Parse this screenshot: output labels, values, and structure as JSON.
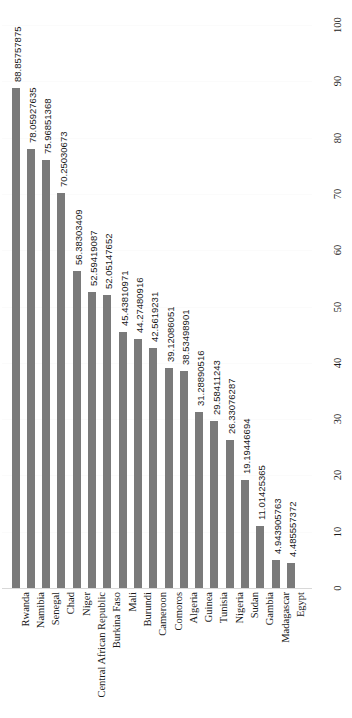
{
  "chart_data": {
    "type": "bar",
    "title": "",
    "subtitle": "",
    "xlabel": "",
    "ylabel": "",
    "orientation": "vertical-rotated",
    "grid": true,
    "legend": false,
    "legend_position": "none",
    "value_axis_position": "right",
    "ylim": [
      0,
      100
    ],
    "yticks": [
      0,
      10,
      20,
      30,
      40,
      50,
      60,
      70,
      80,
      90,
      100
    ],
    "ytick_labels": [
      "0",
      "10",
      "20",
      "30",
      "40",
      "50",
      "60",
      "70",
      "80",
      "90",
      "100"
    ],
    "bar_color": "#7a7a7a",
    "gridline_color": "#fbfbfb",
    "categories": [
      "Rwanda",
      "Namibia",
      "Senegal",
      "Chad",
      "Niger",
      "Central African Republic",
      "Burkina Faso",
      "Mali",
      "Burundi",
      "Cameroon",
      "Comoros",
      "Algeria",
      "Guinea",
      "Tunisia",
      "Nigeria",
      "Sudan",
      "Gambia",
      "Madagascar",
      "Egypt"
    ],
    "values": [
      88.85757875,
      78.05927635,
      75.96851368,
      70.25030673,
      56.38303409,
      52.59419087,
      52.05147652,
      45.43810971,
      44.27480916,
      42.5619231,
      39.12086051,
      38.53498901,
      31.28890516,
      29.58411243,
      26.33076287,
      19.19446694,
      11.01425365,
      4.943905763,
      4.485557372
    ],
    "data_labels": [
      "88.85757875",
      "78.05927635",
      "75.96851368",
      "70.25030673",
      "56.38303409",
      "52.59419087",
      "52.05147652",
      "45.43810971",
      "44.27480916",
      "42.5619231",
      "39.12086051",
      "38.53498901",
      "31.28890516",
      "29.58411243",
      "26.33076287",
      "19.19446694",
      "11.01425365",
      "4.943905763",
      "4.485557372"
    ]
  }
}
